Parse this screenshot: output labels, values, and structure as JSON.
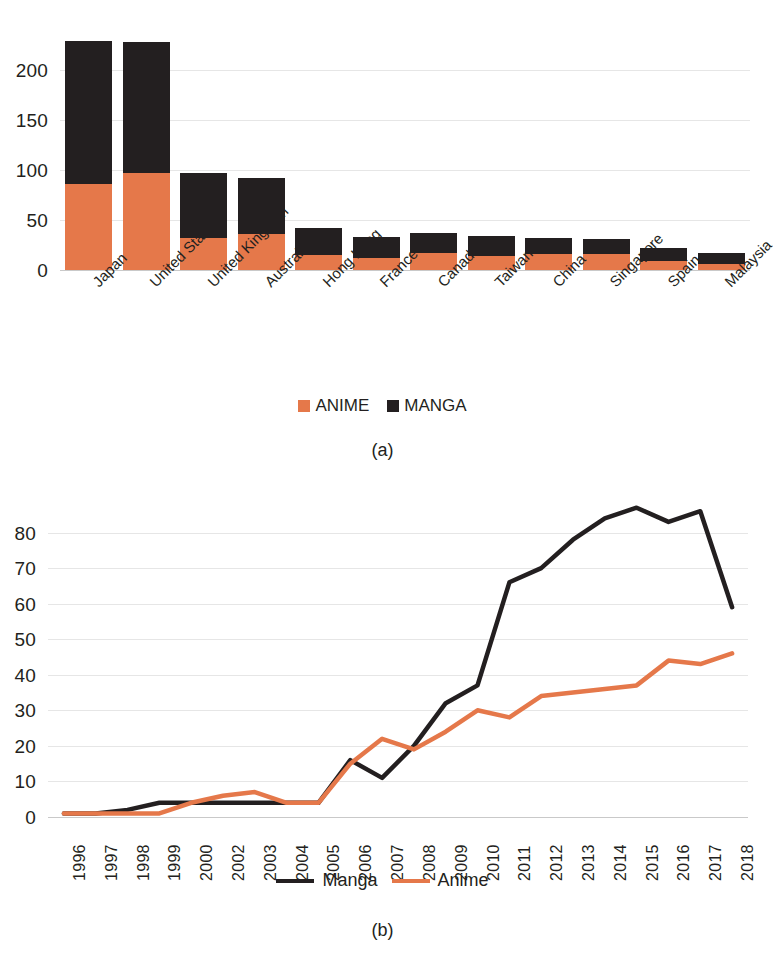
{
  "colors": {
    "anime": "#e5784a",
    "manga": "#231f20",
    "grid": "#e6e6e6",
    "background": "#ffffff"
  },
  "figure_a": {
    "caption": "(a)",
    "legend": [
      {
        "label": "ANIME",
        "color": "#e5784a",
        "marker": "square"
      },
      {
        "label": "MANGA",
        "color": "#231f20",
        "marker": "square"
      }
    ],
    "chart_data": {
      "type": "bar",
      "stacked": true,
      "title": "",
      "xlabel": "",
      "ylabel": "",
      "ylim": [
        0,
        250
      ],
      "yticks": [
        0,
        50,
        100,
        150,
        200
      ],
      "grid": true,
      "legend_position": "bottom",
      "categories": [
        "Japan",
        "United States",
        "United Kingdom",
        "Australia",
        "Hong Kong",
        "France",
        "Canada",
        "Taiwan",
        "China",
        "Singapore",
        "Spain",
        "Malaysia"
      ],
      "series": [
        {
          "name": "ANIME",
          "color": "#e5784a",
          "values": [
            86,
            97,
            32,
            36,
            15,
            12,
            17,
            14,
            16,
            16,
            9,
            6
          ]
        },
        {
          "name": "MANGA",
          "color": "#231f20",
          "values": [
            143,
            131,
            65,
            56,
            27,
            21,
            20,
            20,
            16,
            15,
            13,
            11
          ]
        }
      ],
      "totals": [
        229,
        228,
        97,
        92,
        42,
        33,
        37,
        34,
        32,
        31,
        22,
        17
      ]
    }
  },
  "figure_b": {
    "caption": "(b)",
    "legend": [
      {
        "label": "Manga",
        "color": "#231f20",
        "marker": "line"
      },
      {
        "label": "Anime",
        "color": "#e5784a",
        "marker": "line"
      }
    ],
    "chart_data": {
      "type": "line",
      "title": "",
      "xlabel": "",
      "ylabel": "",
      "ylim": [
        0,
        90
      ],
      "yticks": [
        0,
        10,
        20,
        30,
        40,
        50,
        60,
        70,
        80
      ],
      "grid": true,
      "legend_position": "bottom",
      "x": [
        "1996",
        "1997",
        "1998",
        "1999",
        "2000",
        "2002",
        "2003",
        "2004",
        "2005",
        "2006",
        "2007",
        "2008",
        "2009",
        "2010",
        "2011",
        "2012",
        "2013",
        "2014",
        "2015",
        "2016",
        "2017",
        "2018"
      ],
      "series": [
        {
          "name": "Manga",
          "color": "#231f20",
          "values": [
            1,
            1,
            2,
            4,
            4,
            4,
            4,
            4,
            4,
            16,
            11,
            20,
            32,
            37,
            66,
            70,
            78,
            84,
            87,
            83,
            86,
            59
          ]
        },
        {
          "name": "Anime",
          "color": "#e5784a",
          "values": [
            1,
            1,
            1,
            1,
            4,
            6,
            7,
            4,
            4,
            15,
            22,
            19,
            24,
            30,
            28,
            34,
            35,
            36,
            37,
            44,
            43,
            46
          ]
        }
      ]
    }
  }
}
